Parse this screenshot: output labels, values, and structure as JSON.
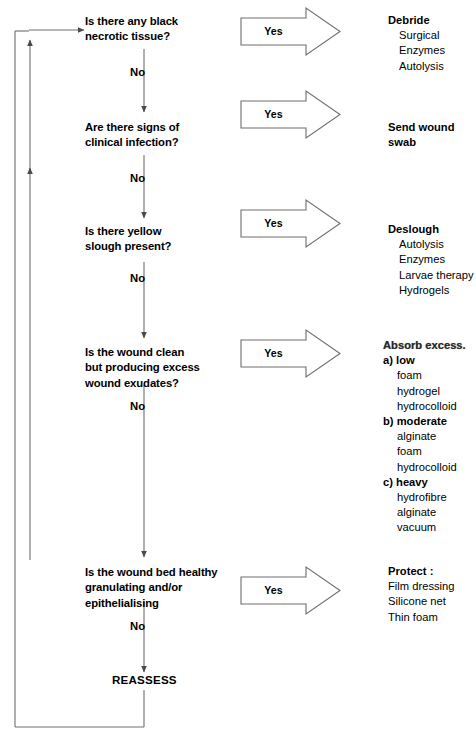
{
  "diagram": {
    "line_color": "#5a5a5a",
    "text_color": "#000000",
    "yes_label": "Yes",
    "no_label": "No",
    "terminal": "REASSESS"
  },
  "steps": [
    {
      "id": "necrotic",
      "question": "Is there any black\nnecrotic tissue?",
      "yes": "Yes",
      "no": "No",
      "action": {
        "heading": "Debride",
        "items": [
          "Surgical",
          "Enzymes",
          "Autolysis"
        ]
      }
    },
    {
      "id": "infection",
      "question": "Are there signs of\nclinical infection?",
      "yes": "Yes",
      "no": "No",
      "action": {
        "heading": "Send wound swab",
        "items": []
      }
    },
    {
      "id": "slough",
      "question": "Is there yellow\nslough present?",
      "yes": "Yes",
      "no": "No",
      "action": {
        "heading": "Deslough",
        "items": [
          "Autolysis",
          "Enzymes",
          "Larvae therapy",
          "Hydrogels"
        ]
      }
    },
    {
      "id": "exudate",
      "question": "Is the wound clean\nbut producing excess\nwound exudates?",
      "yes": "Yes",
      "no": "No",
      "action": {
        "heading": "Absorb excess.",
        "groups": [
          {
            "label": "a) low",
            "items": [
              "foam",
              "hydrogel",
              "hydrocolloid"
            ]
          },
          {
            "label": "b) moderate",
            "items": [
              "alginate",
              "foam",
              "hydrocolloid"
            ]
          },
          {
            "label": "c) heavy",
            "items": [
              "hydrofibre",
              "alginate",
              "vacuum"
            ]
          }
        ]
      }
    },
    {
      "id": "granulating",
      "question": "Is the wound bed healthy\ngranulating and/or\nepithelialising",
      "yes": "Yes",
      "no": "No",
      "action": {
        "heading": "Protect :",
        "items": [
          "Film dressing",
          "Silicone net",
          "Thin foam"
        ]
      }
    }
  ]
}
